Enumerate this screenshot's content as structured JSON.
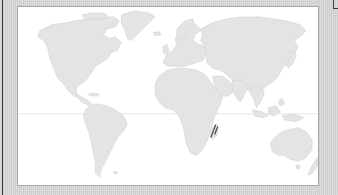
{
  "map": {
    "type": "world-map",
    "projection": "equirectangular",
    "colors": {
      "background": "#d4d4d4",
      "ocean": "#ffffff",
      "land": "#e4e4e4",
      "frame_border": "#a8a8a8",
      "equator_line": "#e0d8d8",
      "highlight_marker": "#444444"
    },
    "regions": [
      "North America",
      "Greenland",
      "South America",
      "Europe",
      "Africa",
      "Asia",
      "Southeast Asia",
      "Australia",
      "New Zealand",
      "Madagascar"
    ],
    "highlighted_region": "Madagascar",
    "features": {
      "equator_line": true
    }
  }
}
